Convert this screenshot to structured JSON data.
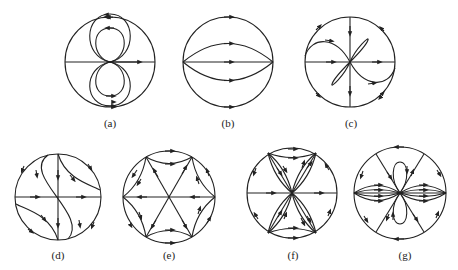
{
  "header_fragment": "",
  "panels": [
    {
      "id": "a",
      "label": "(a)",
      "cx": 110,
      "cy": 62,
      "r": 45
    },
    {
      "id": "b",
      "label": "(b)",
      "cx": 228,
      "cy": 62,
      "r": 45
    },
    {
      "id": "c",
      "label": "(c)",
      "cx": 350,
      "cy": 62,
      "r": 45
    },
    {
      "id": "d",
      "label": "(d)",
      "cx": 58,
      "cy": 197,
      "r": 43
    },
    {
      "id": "e",
      "label": "(e)",
      "cx": 169,
      "cy": 197,
      "r": 46
    },
    {
      "id": "f",
      "label": "(f)",
      "cx": 292,
      "cy": 193,
      "r": 45
    },
    {
      "id": "g",
      "label": "(g)",
      "cx": 400,
      "cy": 193,
      "r": 46
    }
  ],
  "colors": {
    "stroke": "#222222",
    "background": "#ffffff"
  }
}
